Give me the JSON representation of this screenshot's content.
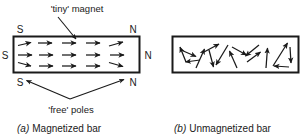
{
  "figure": {
    "background": "#ffffff",
    "ink": "#1a1a1a",
    "annotations": {
      "tiny_magnet": "'tiny' magnet",
      "free_poles": "'free' poles"
    },
    "panels": [
      {
        "id": "a",
        "caption_marker": "(a)",
        "caption_text": "Magnetized bar",
        "caption_full": "(a) Magnetized bar",
        "box": {
          "x": 13,
          "y": 36,
          "width": 127,
          "height": 37
        },
        "pole_labels_left": [
          {
            "text": "S",
            "x": 20,
            "y": 32
          },
          {
            "text": "S",
            "x": 4,
            "y": 58
          },
          {
            "text": "S",
            "x": 20,
            "y": 85
          }
        ],
        "pole_labels_right": [
          {
            "text": "N",
            "x": 131,
            "y": 32
          },
          {
            "text": "N",
            "x": 146,
            "y": 58
          },
          {
            "text": "N",
            "x": 131,
            "y": 85
          }
        ],
        "domain_rows": 3,
        "domain_cols": 4,
        "domain_direction": "aligned-right",
        "description": "Bar with all tiny magnet arrows aligned pointing right (north to the right)"
      },
      {
        "id": "b",
        "caption_marker": "(b)",
        "caption_text": "Unmagnetized bar",
        "caption_full": "(b) Unmagnetized bar",
        "box": {
          "x": 172,
          "y": 36,
          "width": 127,
          "height": 37
        },
        "pole_labels_left": [],
        "pole_labels_right": [],
        "domain_direction": "random",
        "description": "Bar with tiny magnet arrows pointing in random directions"
      }
    ],
    "domains_a": [
      {
        "x1": 18,
        "y1": 45,
        "x2": 33,
        "y2": 42
      },
      {
        "x1": 38,
        "y1": 43,
        "x2": 54,
        "y2": 43
      },
      {
        "x1": 63,
        "y1": 43,
        "x2": 79,
        "y2": 43
      },
      {
        "x1": 88,
        "y1": 43,
        "x2": 104,
        "y2": 43
      },
      {
        "x1": 110,
        "y1": 46,
        "x2": 126,
        "y2": 42
      },
      {
        "x1": 18,
        "y1": 55,
        "x2": 34,
        "y2": 55
      },
      {
        "x1": 40,
        "y1": 55,
        "x2": 56,
        "y2": 55
      },
      {
        "x1": 63,
        "y1": 55,
        "x2": 79,
        "y2": 55
      },
      {
        "x1": 88,
        "y1": 55,
        "x2": 104,
        "y2": 55
      },
      {
        "x1": 111,
        "y1": 55,
        "x2": 127,
        "y2": 55
      },
      {
        "x1": 18,
        "y1": 62,
        "x2": 34,
        "y2": 66
      },
      {
        "x1": 40,
        "y1": 66,
        "x2": 56,
        "y2": 66
      },
      {
        "x1": 63,
        "y1": 66,
        "x2": 79,
        "y2": 66
      },
      {
        "x1": 88,
        "y1": 66,
        "x2": 104,
        "y2": 66
      },
      {
        "x1": 110,
        "y1": 62,
        "x2": 126,
        "y2": 67
      }
    ],
    "domains_b": [
      {
        "x1": 185,
        "y1": 62,
        "x2": 179,
        "y2": 46
      },
      {
        "x1": 181,
        "y1": 50,
        "x2": 198,
        "y2": 57
      },
      {
        "x1": 200,
        "y1": 60,
        "x2": 184,
        "y2": 62
      },
      {
        "x1": 196,
        "y1": 68,
        "x2": 205,
        "y2": 48
      },
      {
        "x1": 203,
        "y1": 52,
        "x2": 220,
        "y2": 43
      },
      {
        "x1": 209,
        "y1": 49,
        "x2": 214,
        "y2": 68
      },
      {
        "x1": 228,
        "y1": 44,
        "x2": 215,
        "y2": 66
      },
      {
        "x1": 237,
        "y1": 68,
        "x2": 229,
        "y2": 50
      },
      {
        "x1": 232,
        "y1": 46,
        "x2": 248,
        "y2": 55
      },
      {
        "x1": 259,
        "y1": 44,
        "x2": 244,
        "y2": 56
      },
      {
        "x1": 247,
        "y1": 62,
        "x2": 262,
        "y2": 51
      },
      {
        "x1": 266,
        "y1": 68,
        "x2": 268,
        "y2": 47
      },
      {
        "x1": 272,
        "y1": 66,
        "x2": 289,
        "y2": 42
      },
      {
        "x1": 290,
        "y1": 46,
        "x2": 291,
        "y2": 64
      },
      {
        "x1": 289,
        "y1": 67,
        "x2": 272,
        "y2": 66
      }
    ],
    "leaders": {
      "tiny_magnet": {
        "x1": 58,
        "y1": 16,
        "x2": 76,
        "y2": 38
      },
      "free_poles_left": {
        "x1": 68,
        "y1": 98,
        "x2": 24,
        "y2": 80
      },
      "free_poles_right": {
        "x1": 68,
        "y1": 98,
        "x2": 126,
        "y2": 79
      }
    },
    "text_positions": {
      "tiny_magnet": {
        "x": 77,
        "y": 12,
        "anchor": "middle"
      },
      "free_poles": {
        "x": 71,
        "y": 113,
        "anchor": "middle"
      },
      "caption_a": {
        "x": 18,
        "y": 131,
        "anchor": "start"
      },
      "caption_b": {
        "x": 175,
        "y": 131,
        "anchor": "start"
      }
    }
  }
}
